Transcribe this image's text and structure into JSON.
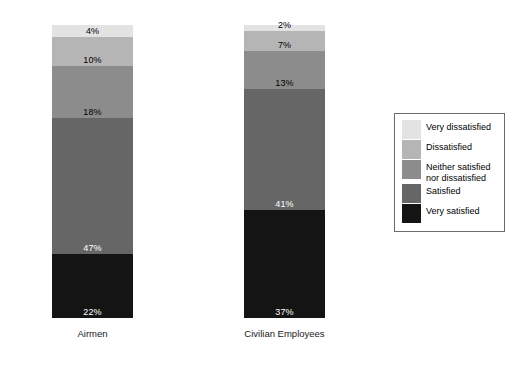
{
  "chart_data": {
    "type": "bar",
    "subtype": "100% stacked bar",
    "title": "",
    "subtitle": "",
    "xlabel": "",
    "ylabel": "",
    "ylim": [
      0,
      100
    ],
    "grid": false,
    "legend_position": "right",
    "categories": [
      "Airmen",
      "Civilian Employees"
    ],
    "series": [
      {
        "name": "Very dissatisfied",
        "color": "#e3e3e3",
        "values": [
          4,
          2
        ]
      },
      {
        "name": "Dissatisfied",
        "color": "#b5b5b5",
        "values": [
          10,
          7
        ]
      },
      {
        "name": "Neither satisfied nor dissatisfied",
        "color": "#8c8c8c",
        "values": [
          18,
          13
        ]
      },
      {
        "name": "Satisfied",
        "color": "#666666",
        "values": [
          47,
          41
        ]
      },
      {
        "name": "Very satisfied",
        "color": "#141414",
        "values": [
          22,
          37
        ]
      }
    ],
    "stack_order_top_to_bottom": [
      "Very dissatisfied",
      "Dissatisfied",
      "Neither satisfied nor dissatisfied",
      "Satisfied",
      "Very satisfied"
    ]
  },
  "bars": [
    {
      "category": "Airmen",
      "segments": [
        {
          "key": "very-dissatisfied",
          "label": "4%",
          "value": 4,
          "color": "#e3e3e3",
          "text": "dark"
        },
        {
          "key": "dissatisfied",
          "label": "10%",
          "value": 10,
          "color": "#b5b5b5",
          "text": "dark"
        },
        {
          "key": "neither",
          "label": "18%",
          "value": 18,
          "color": "#8c8c8c",
          "text": "dark"
        },
        {
          "key": "satisfied",
          "label": "47%",
          "value": 47,
          "color": "#666666",
          "text": "light"
        },
        {
          "key": "very-satisfied",
          "label": "22%",
          "value": 22,
          "color": "#141414",
          "text": "light"
        }
      ]
    },
    {
      "category": "Civilian Employees",
      "segments": [
        {
          "key": "very-dissatisfied",
          "label": "2%",
          "value": 2,
          "color": "#e3e3e3",
          "text": "dark"
        },
        {
          "key": "dissatisfied",
          "label": "7%",
          "value": 7,
          "color": "#b5b5b5",
          "text": "dark"
        },
        {
          "key": "neither",
          "label": "13%",
          "value": 13,
          "color": "#8c8c8c",
          "text": "dark"
        },
        {
          "key": "satisfied",
          "label": "41%",
          "value": 41,
          "color": "#666666",
          "text": "light"
        },
        {
          "key": "very-satisfied",
          "label": "37%",
          "value": 37,
          "color": "#141414",
          "text": "light"
        }
      ]
    }
  ],
  "legend": {
    "items": [
      {
        "label": "Very dissatisfied",
        "color": "#e3e3e3"
      },
      {
        "label": "Dissatisfied",
        "color": "#b5b5b5"
      },
      {
        "label": "Neither satisfied\nnor dissatisfied",
        "color": "#8c8c8c"
      },
      {
        "label": "Satisfied",
        "color": "#666666"
      },
      {
        "label": "Very satisfied",
        "color": "#141414"
      }
    ]
  }
}
